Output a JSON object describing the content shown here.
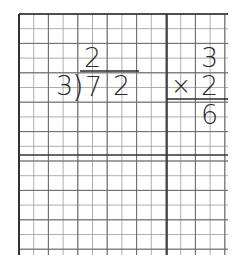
{
  "worksheet": {
    "grid": {
      "left": 19,
      "top": 14,
      "right": 228,
      "bottom": 255,
      "cell": 14.7,
      "major_vertical_x": 167,
      "major_horizontal_y": 155,
      "line_color": "#9a9a9a",
      "major_line_color": "#333333"
    },
    "division": {
      "quotient": "2",
      "divisor": "3",
      "bracket": ")",
      "dividend_digits": [
        "7",
        "2"
      ]
    },
    "multiplication": {
      "top": "3",
      "operator": "×",
      "bottom": "2",
      "result": "6"
    }
  }
}
